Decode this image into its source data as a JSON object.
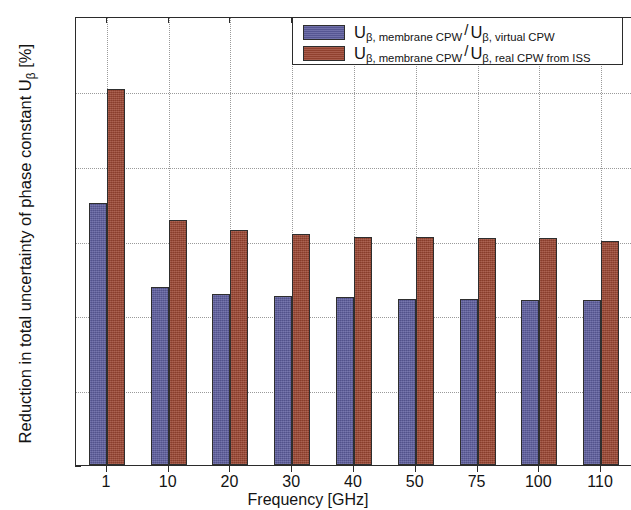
{
  "chart_data": {
    "type": "bar",
    "title": "",
    "xlabel": "Frequency [GHz]",
    "ylabel": "Reduction in total uncertainty of phase constant Uβ [%]",
    "categories": [
      "1",
      "10",
      "20",
      "30",
      "40",
      "50",
      "75",
      "100",
      "110"
    ],
    "series": [
      {
        "name": "Uβ, membrane CPW / Uβ, virtual CPW",
        "color": "#5d5d9e",
        "values": [
          17.5,
          11.9,
          11.4,
          11.3,
          11.2,
          11.1,
          11.1,
          11.0,
          11.0
        ]
      },
      {
        "name": "Uβ, membrane CPW / Uβ, real CPW from ISS",
        "color": "#9c4632",
        "values": [
          25.1,
          16.4,
          15.7,
          15.45,
          15.25,
          15.25,
          15.2,
          15.15,
          15.0
        ]
      }
    ],
    "ylim": [
      0,
      30
    ],
    "yticks": [
      0,
      5,
      10,
      15,
      20,
      25,
      30
    ],
    "ytick_labels": [
      "0",
      "5",
      "10",
      "15",
      "20",
      "25",
      "30"
    ],
    "grid": "horizontal-and-vertical-dotted",
    "legend_position": "top-right"
  },
  "axis": {
    "x_title": "Frequency [GHz]",
    "y_title_main": "Reduction in total uncertainty of phase constant U",
    "y_title_sub": "β",
    "y_title_unit": " [%]"
  },
  "legend": {
    "entries": [
      {
        "symbol": "U",
        "sub_numerator": "β, membrane CPW",
        "slash": "/",
        "symbol2": "U",
        "sub_denominator": "β, virtual CPW",
        "color": "#5d5d9e"
      },
      {
        "symbol": "U",
        "sub_numerator": "β, membrane CPW",
        "slash": "/",
        "symbol2": "U",
        "sub_denominator": "β, real CPW from ISS",
        "color": "#9c4632"
      }
    ]
  }
}
